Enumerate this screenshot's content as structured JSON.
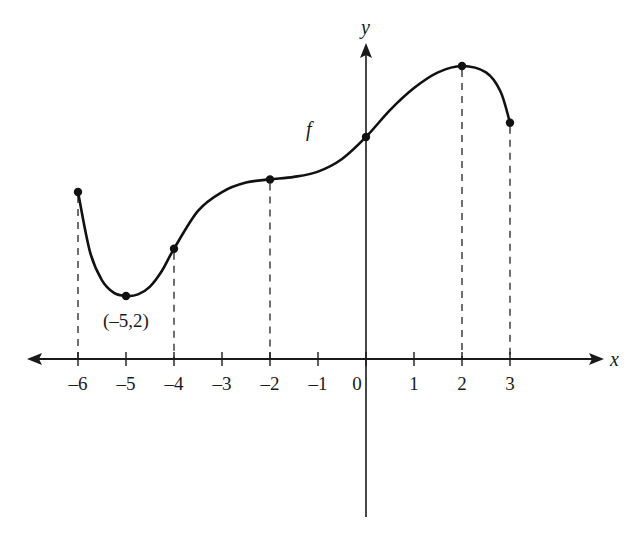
{
  "chart_data": {
    "type": "line",
    "title": "",
    "xlabel": "x",
    "ylabel": "y",
    "function_label": "f",
    "xlim": [
      -7,
      4
    ],
    "x_ticks": [
      -6,
      -5,
      -4,
      -3,
      -2,
      -1,
      0,
      1,
      2,
      3
    ],
    "x_tick_labels": [
      "–6",
      "–5",
      "–4",
      "–3",
      "–2",
      "–1",
      "0",
      "1",
      "2",
      "3"
    ],
    "grid": false,
    "domain": [
      -6,
      3
    ],
    "marked_points": [
      {
        "x": -6,
        "y": 5.3,
        "label": ""
      },
      {
        "x": -5,
        "y": 2,
        "label": "(–5,2)"
      },
      {
        "x": -4,
        "y": 3.5,
        "label": ""
      },
      {
        "x": -2,
        "y": 5.7,
        "label": ""
      },
      {
        "x": 0,
        "y": 7.05,
        "label": ""
      },
      {
        "x": 2,
        "y": 9.3,
        "label": ""
      },
      {
        "x": 3,
        "y": 7.5,
        "label": ""
      }
    ],
    "dashed_drop_lines_at_x": [
      -6,
      -4,
      -2,
      2,
      3
    ],
    "curve_samples": [
      {
        "x": -6,
        "y": 5.3
      },
      {
        "x": -5.75,
        "y": 3.4
      },
      {
        "x": -5.5,
        "y": 2.5
      },
      {
        "x": -5.25,
        "y": 2.1
      },
      {
        "x": -5,
        "y": 2
      },
      {
        "x": -4.75,
        "y": 2.05
      },
      {
        "x": -4.5,
        "y": 2.3
      },
      {
        "x": -4.25,
        "y": 2.8
      },
      {
        "x": -4,
        "y": 3.5
      },
      {
        "x": -3.5,
        "y": 4.7
      },
      {
        "x": -3,
        "y": 5.3
      },
      {
        "x": -2.5,
        "y": 5.6
      },
      {
        "x": -2,
        "y": 5.7
      },
      {
        "x": -1.5,
        "y": 5.78
      },
      {
        "x": -1,
        "y": 5.95
      },
      {
        "x": -0.5,
        "y": 6.35
      },
      {
        "x": 0,
        "y": 7.05
      },
      {
        "x": 0.5,
        "y": 7.9
      },
      {
        "x": 1,
        "y": 8.6
      },
      {
        "x": 1.5,
        "y": 9.1
      },
      {
        "x": 2,
        "y": 9.3
      },
      {
        "x": 2.5,
        "y": 9.1
      },
      {
        "x": 2.8,
        "y": 8.5
      },
      {
        "x": 3,
        "y": 7.5
      }
    ],
    "annotations": [
      {
        "text": "(–5,2)",
        "at": {
          "x": -5,
          "y": 2
        },
        "position": "below"
      },
      {
        "text": "f",
        "at": {
          "x": -1.1,
          "y": 7.3
        },
        "position": "label"
      }
    ]
  }
}
